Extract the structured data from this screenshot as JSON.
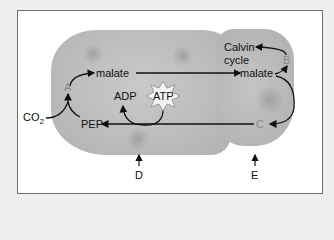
{
  "diagram": {
    "type": "C4 photosynthesis pathway (mesophyll and bundle-sheath cells)",
    "labels": {
      "malate_left": "malate",
      "malate_right": "malate",
      "calvin_line1": "Calvin",
      "calvin_line2": "cycle",
      "adp": "ADP",
      "atp": "ATP",
      "co2": "CO",
      "co2_sub": "2",
      "pep": "PEP"
    },
    "markers": {
      "a": "A",
      "b": "B",
      "c": "C",
      "d": "D",
      "e": "E"
    },
    "colors": {
      "background": "#efefef",
      "frame_border": "#6f6f6f",
      "cell_fill": "#bdbdbd",
      "marker_text": "#8a8a8a",
      "arrow": "#111111"
    }
  }
}
